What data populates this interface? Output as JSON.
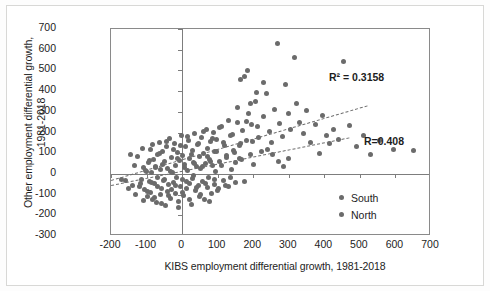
{
  "chart_data": {
    "type": "scatter",
    "title": "",
    "xlabel": "KIBS employment differential growth, 1981-2018",
    "ylabel_line1": "Other employment differential growth,",
    "ylabel_line2": "1981-2018",
    "xlim": [
      -200,
      700
    ],
    "ylim": [
      -300,
      700
    ],
    "xticks": [
      -200,
      -100,
      0,
      100,
      200,
      300,
      400,
      500,
      600,
      700
    ],
    "yticks": [
      -300,
      -200,
      -100,
      0,
      100,
      200,
      300,
      400,
      500,
      600,
      700
    ],
    "grid": false,
    "legend_position": "inside-bottom-right",
    "marker_color": "#6b6b6b",
    "frame_color": "#8a8a8a",
    "annotations": [
      {
        "name": "r-squared",
        "text": "R² = 0.3158"
      },
      {
        "name": "correlation",
        "text": "R=0.408"
      }
    ],
    "legend": [
      {
        "label": "South",
        "color": "#6b6b6b"
      },
      {
        "label": "North",
        "color": "#6b6b6b"
      }
    ],
    "trendlines": [
      {
        "name": "upper-trendline",
        "style": "dashed",
        "x0": -200,
        "y0": -30,
        "x1": 520,
        "y1": 330
      },
      {
        "name": "lower-trendline",
        "style": "dashed",
        "x0": -200,
        "y0": -55,
        "x1": 470,
        "y1": 175
      }
    ],
    "series": [
      {
        "name": "South",
        "points": [
          [
            -145,
            95
          ],
          [
            -140,
            -55
          ],
          [
            -120,
            -60
          ],
          [
            -115,
            -25
          ],
          [
            -110,
            30
          ],
          [
            -105,
            -75
          ],
          [
            -100,
            10
          ],
          [
            -98,
            -110
          ],
          [
            -95,
            55
          ],
          [
            -92,
            -35
          ],
          [
            -90,
            120
          ],
          [
            -88,
            -90
          ],
          [
            -85,
            5
          ],
          [
            -82,
            -125
          ],
          [
            -80,
            70
          ],
          [
            -78,
            -45
          ],
          [
            -75,
            35
          ],
          [
            -72,
            -140
          ],
          [
            -70,
            95
          ],
          [
            -68,
            -15
          ],
          [
            -65,
            150
          ],
          [
            -62,
            -100
          ],
          [
            -60,
            20
          ],
          [
            -58,
            -70
          ],
          [
            -55,
            110
          ],
          [
            -52,
            -30
          ],
          [
            -50,
            60
          ],
          [
            -48,
            -155
          ],
          [
            -45,
            130
          ],
          [
            -42,
            -85
          ],
          [
            -40,
            25
          ],
          [
            -38,
            -50
          ],
          [
            -35,
            170
          ],
          [
            -32,
            -120
          ],
          [
            -30,
            80
          ],
          [
            -28,
            5
          ],
          [
            -25,
            -40
          ],
          [
            -22,
            145
          ],
          [
            -20,
            -95
          ],
          [
            -18,
            40
          ],
          [
            -15,
            -15
          ],
          [
            -12,
            105
          ],
          [
            -10,
            -135
          ],
          [
            -8,
            65
          ],
          [
            -5,
            -60
          ],
          [
            -2,
            185
          ],
          [
            0,
            -25
          ],
          [
            2,
            90
          ],
          [
            5,
            -105
          ],
          [
            8,
            45
          ],
          [
            10,
            130
          ],
          [
            12,
            -70
          ],
          [
            15,
            15
          ],
          [
            18,
            160
          ],
          [
            20,
            -45
          ],
          [
            22,
            75
          ],
          [
            25,
            -150
          ],
          [
            28,
            115
          ],
          [
            30,
            -20
          ],
          [
            32,
            55
          ],
          [
            35,
            195
          ],
          [
            38,
            -80
          ],
          [
            40,
            35
          ],
          [
            42,
            140
          ],
          [
            45,
            -55
          ],
          [
            48,
            85
          ],
          [
            50,
            -110
          ],
          [
            52,
            25
          ],
          [
            55,
            175
          ],
          [
            58,
            -35
          ],
          [
            60,
            100
          ],
          [
            62,
            -125
          ],
          [
            65,
            50
          ],
          [
            68,
            215
          ],
          [
            70,
            -65
          ],
          [
            72,
            125
          ],
          [
            75,
            -15
          ],
          [
            78,
            70
          ],
          [
            80,
            155
          ],
          [
            82,
            -95
          ],
          [
            85,
            40
          ],
          [
            88,
            200
          ],
          [
            90,
            -50
          ],
          [
            92,
            110
          ],
          [
            95,
            10
          ],
          [
            98,
            165
          ],
          [
            100,
            -80
          ],
          [
            105,
            60
          ],
          [
            110,
            230
          ],
          [
            115,
            -30
          ],
          [
            120,
            135
          ],
          [
            125,
            90
          ],
          [
            130,
            -60
          ],
          [
            135,
            185
          ],
          [
            140,
            20
          ],
          [
            145,
            115
          ],
          [
            150,
            -40
          ],
          [
            155,
            250
          ],
          [
            160,
            75
          ],
          [
            165,
            145
          ]
        ]
      },
      {
        "name": "North",
        "points": [
          [
            -160,
            -30
          ],
          [
            -150,
            -70
          ],
          [
            -135,
            40
          ],
          [
            -130,
            -100
          ],
          [
            -125,
            85
          ],
          [
            -118,
            -45
          ],
          [
            -112,
            125
          ],
          [
            -108,
            -130
          ],
          [
            -102,
            15
          ],
          [
            -96,
            -85
          ],
          [
            -93,
            65
          ],
          [
            -87,
            -40
          ],
          [
            -84,
            140
          ],
          [
            -79,
            -115
          ],
          [
            -74,
            30
          ],
          [
            -69,
            -60
          ],
          [
            -64,
            100
          ],
          [
            -59,
            -145
          ],
          [
            -54,
            45
          ],
          [
            -49,
            -25
          ],
          [
            -44,
            155
          ],
          [
            -39,
            -105
          ],
          [
            -34,
            10
          ],
          [
            -29,
            -75
          ],
          [
            -24,
            120
          ],
          [
            -19,
            -55
          ],
          [
            -14,
            75
          ],
          [
            -9,
            -160
          ],
          [
            -4,
            135
          ],
          [
            1,
            -90
          ],
          [
            6,
            30
          ],
          [
            11,
            -35
          ],
          [
            16,
            180
          ],
          [
            21,
            -125
          ],
          [
            26,
            95
          ],
          [
            31,
            -10
          ],
          [
            36,
            50
          ],
          [
            41,
            -65
          ],
          [
            46,
            145
          ],
          [
            51,
            -100
          ],
          [
            56,
            35
          ],
          [
            61,
            205
          ],
          [
            66,
            -45
          ],
          [
            71,
            85
          ],
          [
            76,
            -135
          ],
          [
            81,
            60
          ],
          [
            86,
            170
          ],
          [
            91,
            -25
          ],
          [
            96,
            110
          ],
          [
            101,
            -70
          ],
          [
            106,
            225
          ],
          [
            111,
            40
          ],
          [
            116,
            150
          ],
          [
            121,
            -55
          ],
          [
            126,
            80
          ],
          [
            131,
            260
          ],
          [
            136,
            -15
          ],
          [
            141,
            190
          ],
          [
            146,
            105
          ],
          [
            151,
            55
          ],
          [
            156,
            320
          ],
          [
            161,
            135
          ],
          [
            166,
            70
          ],
          [
            171,
            210
          ],
          [
            176,
            -35
          ],
          [
            181,
            160
          ],
          [
            186,
            290
          ],
          [
            191,
            95
          ],
          [
            196,
            240
          ],
          [
            201,
            45
          ],
          [
            206,
            350
          ],
          [
            215,
            175
          ],
          [
            222,
            110
          ],
          [
            230,
            275
          ],
          [
            238,
            390
          ],
          [
            245,
            205
          ],
          [
            252,
            150
          ],
          [
            260,
            310
          ],
          [
            268,
            630
          ],
          [
            275,
            245
          ],
          [
            283,
            180
          ],
          [
            290,
            430
          ],
          [
            298,
            290
          ],
          [
            305,
            215
          ],
          [
            315,
            560
          ],
          [
            322,
            340
          ],
          [
            330,
            250
          ],
          [
            340,
            195
          ],
          [
            350,
            305
          ],
          [
            360,
            150
          ],
          [
            375,
            240
          ],
          [
            385,
            100
          ],
          [
            395,
            280
          ],
          [
            405,
            185
          ],
          [
            415,
            145
          ],
          [
            425,
            215
          ],
          [
            440,
            165
          ],
          [
            455,
            545
          ],
          [
            470,
            235
          ],
          [
            490,
            130
          ],
          [
            510,
            185
          ],
          [
            530,
            95
          ],
          [
            555,
            160
          ],
          [
            595,
            120
          ],
          [
            650,
            115
          ],
          [
            185,
            500
          ],
          [
            175,
            470
          ],
          [
            210,
            395
          ],
          [
            228,
            440
          ],
          [
            192,
            340
          ],
          [
            240,
            120
          ],
          [
            255,
            95
          ],
          [
            270,
            60
          ],
          [
            285,
            35
          ],
          [
            300,
            75
          ],
          [
            -170,
            -25
          ],
          [
            165,
            455
          ],
          [
            180,
            255
          ],
          [
            198,
            155
          ],
          [
            212,
            230
          ]
        ]
      }
    ]
  }
}
